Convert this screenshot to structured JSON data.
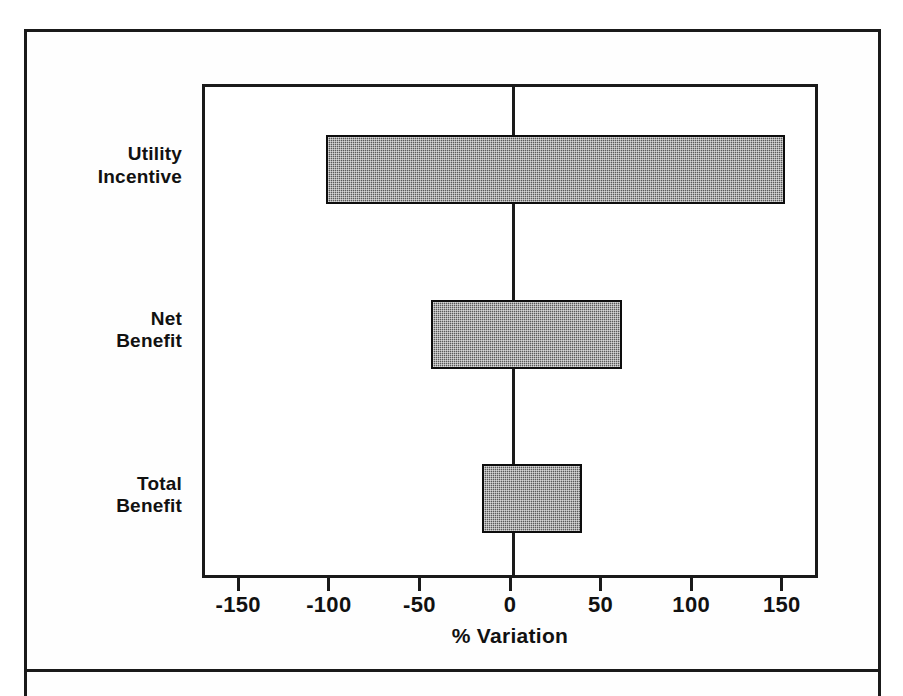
{
  "figure": {
    "has_outer_border": true,
    "background_color": "#ffffff",
    "border_color": "#1a1a1a"
  },
  "chart_data": {
    "type": "bar",
    "orientation": "horizontal",
    "subtype": "tornado",
    "title": "",
    "xlabel": "% Variation",
    "ylabel": "",
    "categories": [
      "Utility\nIncentive",
      "Net\nBenefit",
      "Total\nBenefit"
    ],
    "bars": [
      {
        "category": "Utility\nIncentive",
        "low": -103,
        "high": 150
      },
      {
        "category": "Net\nBenefit",
        "low": -45,
        "high": 60
      },
      {
        "category": "Total\nBenefit",
        "low": -17,
        "high": 38
      }
    ],
    "xlim": [
      -170,
      170
    ],
    "xticks": [
      -150,
      -100,
      -50,
      0,
      50,
      100,
      150
    ],
    "xticklabels": [
      "-150",
      "-100",
      "-50",
      "0",
      "50",
      "100",
      "150"
    ],
    "grid": false,
    "legend": null,
    "zero_reference_line": 0,
    "bar_fill_color": "#5a5a5a",
    "bar_edge_color": "#0d0d0d",
    "axis_color": "#1a1a1a"
  }
}
